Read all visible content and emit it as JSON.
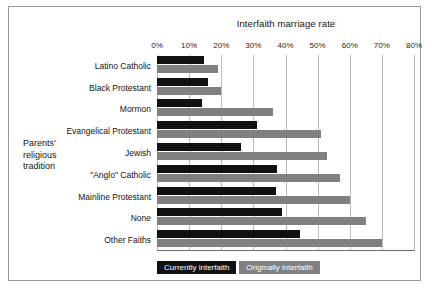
{
  "chart_data": {
    "type": "bar",
    "orientation": "horizontal",
    "title": "Interfaith marriage rate",
    "xlabel": "",
    "ylabel": "Parents' religious tradition",
    "ylabel_lines": [
      "Parents'",
      "religious",
      "tradition"
    ],
    "xlim": [
      0,
      80
    ],
    "xticks": [
      0,
      10,
      20,
      30,
      40,
      50,
      60,
      70,
      80
    ],
    "xtick_labels": [
      "0%",
      "10%",
      "20%",
      "30%",
      "40%",
      "50%",
      "60%",
      "70%",
      "80%"
    ],
    "grid": true,
    "grid_axis": "x",
    "legend_position": "bottom-left",
    "categories": [
      "Latino Catholic",
      "Black Protestant",
      "Mormon",
      "Evangelical Protestant",
      "Jewish",
      "\"Anglo\" Catholic",
      "Mainline Protestant",
      "None",
      "Other Faiths"
    ],
    "series": [
      {
        "name": "Currently interfaith",
        "color": "#111111",
        "values": [
          14.5,
          16,
          14,
          31,
          26,
          37.5,
          37,
          39,
          44.5
        ]
      },
      {
        "name": "Originally interfaith",
        "color": "#808080",
        "values": [
          19,
          20,
          36,
          51,
          53,
          57,
          60,
          65,
          70
        ]
      }
    ]
  },
  "legend": {
    "items": [
      {
        "label": "Currently interfaith",
        "color": "#111111"
      },
      {
        "label": "Originally interfaith",
        "color": "#808080"
      }
    ]
  }
}
